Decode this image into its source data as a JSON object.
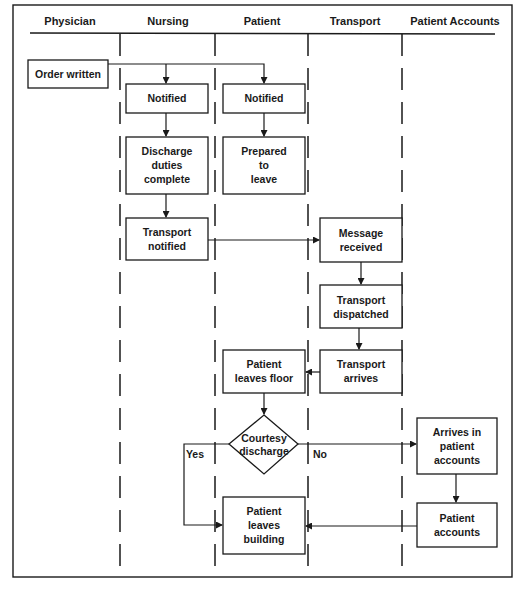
{
  "diagram": {
    "type": "swimlane-flowchart",
    "title_fragment": "",
    "lanes": [
      {
        "id": "physician",
        "label": "Physician"
      },
      {
        "id": "nursing",
        "label": "Nursing"
      },
      {
        "id": "patient",
        "label": "Patient"
      },
      {
        "id": "transport",
        "label": "Transport"
      },
      {
        "id": "accounts",
        "label": "Patient Accounts"
      }
    ],
    "nodes": {
      "order_written": {
        "lane": "physician",
        "shape": "rect",
        "lines": [
          "Order written"
        ]
      },
      "nursing_notified": {
        "lane": "nursing",
        "shape": "rect",
        "lines": [
          "Notified"
        ]
      },
      "patient_notified": {
        "lane": "patient",
        "shape": "rect",
        "lines": [
          "Notified"
        ]
      },
      "discharge_duties": {
        "lane": "nursing",
        "shape": "rect",
        "lines": [
          "Discharge",
          "duties",
          "complete"
        ]
      },
      "prepared_to_leave": {
        "lane": "patient",
        "shape": "rect",
        "lines": [
          "Prepared",
          "to",
          "leave"
        ]
      },
      "transport_notified": {
        "lane": "nursing",
        "shape": "rect",
        "lines": [
          "Transport",
          "notified"
        ]
      },
      "message_received": {
        "lane": "transport",
        "shape": "rect",
        "lines": [
          "Message",
          "received"
        ]
      },
      "transport_dispatched": {
        "lane": "transport",
        "shape": "rect",
        "lines": [
          "Transport",
          "dispatched"
        ]
      },
      "transport_arrives": {
        "lane": "transport",
        "shape": "rect",
        "lines": [
          "Transport",
          "arrives"
        ]
      },
      "patient_leaves_floor": {
        "lane": "patient",
        "shape": "rect",
        "lines": [
          "Patient",
          "leaves floor"
        ]
      },
      "courtesy_discharge": {
        "lane": "patient",
        "shape": "diamond",
        "lines": [
          "Courtesy",
          "discharge"
        ]
      },
      "arrives_in_accounts": {
        "lane": "accounts",
        "shape": "rect",
        "lines": [
          "Arrives in",
          "patient",
          "accounts"
        ]
      },
      "patient_accounts": {
        "lane": "accounts",
        "shape": "rect",
        "lines": [
          "Patient",
          "accounts"
        ]
      },
      "patient_leaves_building": {
        "lane": "patient",
        "shape": "rect",
        "lines": [
          "Patient",
          "leaves",
          "building"
        ]
      }
    },
    "edges": [
      {
        "from": "order_written",
        "to": "nursing_notified",
        "label": ""
      },
      {
        "from": "order_written",
        "to": "patient_notified",
        "label": ""
      },
      {
        "from": "nursing_notified",
        "to": "discharge_duties",
        "label": ""
      },
      {
        "from": "patient_notified",
        "to": "prepared_to_leave",
        "label": ""
      },
      {
        "from": "discharge_duties",
        "to": "transport_notified",
        "label": ""
      },
      {
        "from": "transport_notified",
        "to": "message_received",
        "label": ""
      },
      {
        "from": "message_received",
        "to": "transport_dispatched",
        "label": ""
      },
      {
        "from": "transport_dispatched",
        "to": "transport_arrives",
        "label": ""
      },
      {
        "from": "transport_arrives",
        "to": "patient_leaves_floor",
        "label": ""
      },
      {
        "from": "patient_leaves_floor",
        "to": "courtesy_discharge",
        "label": ""
      },
      {
        "from": "courtesy_discharge",
        "to": "patient_leaves_building",
        "label": "Yes"
      },
      {
        "from": "courtesy_discharge",
        "to": "arrives_in_accounts",
        "label": "No"
      },
      {
        "from": "arrives_in_accounts",
        "to": "patient_accounts",
        "label": ""
      },
      {
        "from": "patient_accounts",
        "to": "patient_leaves_building",
        "label": ""
      }
    ],
    "edge_labels": {
      "yes": "Yes",
      "no": "No"
    },
    "colors": {
      "ink": "#1a1a1a",
      "background": "#ffffff"
    }
  }
}
